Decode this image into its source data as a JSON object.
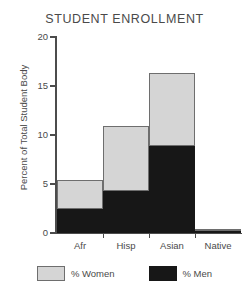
{
  "chart_data": {
    "type": "bar",
    "subtype": "stacked-vertical",
    "title": "STUDENT ENROLLMENT",
    "xlabel": "",
    "ylabel": "Percent of Total Student Body",
    "categories": [
      "Afr",
      "Hisp",
      "Asian",
      "Native"
    ],
    "series": [
      {
        "name": "% Men",
        "color": "#171717",
        "values": [
          2.4,
          4.3,
          8.9,
          0.2
        ]
      },
      {
        "name": "% Women",
        "color": "#d5d5d5",
        "values": [
          3.0,
          6.6,
          7.4,
          0.2
        ]
      }
    ],
    "totals": [
      5.4,
      10.9,
      16.3,
      0.4
    ],
    "ylim": [
      0,
      20
    ],
    "yticks": [
      0,
      5,
      10,
      15,
      20
    ],
    "ytick_labels": [
      "0",
      "5",
      "10",
      "15",
      "20"
    ],
    "grid": false,
    "legend_position": "bottom",
    "legend": [
      {
        "label": "% Women",
        "color": "#d5d5d5"
      },
      {
        "label": "% Men",
        "color": "#171717"
      }
    ]
  },
  "colors": {
    "women": "#d5d5d5",
    "men": "#171717",
    "axis": "#4c4c4c",
    "text": "#4a4a4a",
    "background": "#ffffff"
  }
}
